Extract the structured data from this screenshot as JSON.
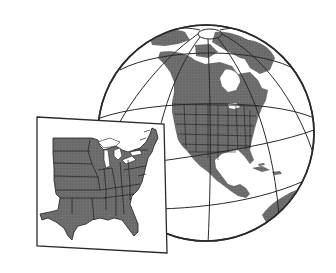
{
  "illustration": {
    "subject": "globe-with-inset-map",
    "globe": {
      "center": [
        206,
        133
      ],
      "radius": 108,
      "region_shown": "North America",
      "graticule": true
    },
    "inset": {
      "region_shown": "Eastern United States",
      "corners": [
        [
          37,
          117
        ],
        [
          164,
          124
        ],
        [
          167,
          253
        ],
        [
          37,
          246
        ]
      ]
    },
    "colors": {
      "background": "#ffffff",
      "land": "#6b6b6b",
      "land_dark": "#555555",
      "ocean": "#ffffff",
      "outline": "#2a2a2a",
      "state_borders": "#1e1e1e"
    }
  }
}
